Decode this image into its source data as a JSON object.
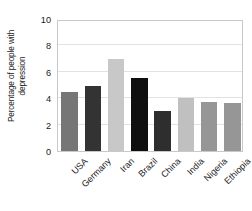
{
  "chart_data": {
    "type": "bar",
    "title": "",
    "subtitle": "",
    "xlabel": "",
    "ylabel": "Percentage of people with depression",
    "ylabel_lines": [
      "Percentage of people with",
      "depression"
    ],
    "categories": [
      "USA",
      "Germany",
      "Iran",
      "Brazil",
      "China",
      "India",
      "Nigeria",
      "Ethiopia"
    ],
    "values": [
      4.5,
      4.9,
      7.0,
      5.5,
      3.0,
      4.05,
      3.7,
      3.65
    ],
    "bar_colors": [
      "#767676",
      "#333333",
      "#c8c8c8",
      "#0f0f0f",
      "#2e2e2e",
      "#c0c0c0",
      "#969696",
      "#969696"
    ],
    "ylim": [
      0,
      10
    ],
    "yticks": [
      0,
      2,
      4,
      6,
      8,
      10
    ],
    "ytick_labels": [
      "0",
      "2",
      "4",
      "6",
      "8",
      "10"
    ],
    "grid": true,
    "grid_axis": "y",
    "grid_color": "#e2e2e2",
    "legend": false,
    "legend_position": "none",
    "frame_color": "#c9c9c9",
    "background": "#ffffff",
    "xtick_rotation": -45
  }
}
